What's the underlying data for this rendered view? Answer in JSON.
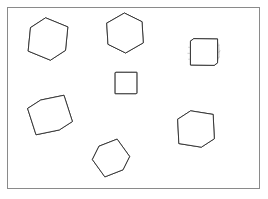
{
  "figure": {
    "background_color": "#ffffff",
    "frame": {
      "name": "outer-frame",
      "x": 7.5,
      "y": 7.5,
      "width": 252,
      "height": 181,
      "stroke_color": "#8a8a8a",
      "stroke_width": 1
    },
    "style": {
      "outline_color": "#2b2b2b",
      "grid_color": "#9a9a9a",
      "edge_color": "#3a3a3a",
      "face_fill": "#ffffff",
      "subdivisions": 4
    }
  },
  "shapes": [
    {
      "id": "cube-top-left",
      "label": "Isometric cube, top-left",
      "kind": "cube-iso",
      "center": [
        48,
        39
      ],
      "size": 27,
      "yaw": 34,
      "pitch": 26,
      "roll": 6,
      "subdivisions": 4,
      "bulge": 0
    },
    {
      "id": "cube-top-middle",
      "label": "Hexagonal silhouette cube, top-middle",
      "kind": "cube-hex",
      "center": [
        125,
        33
      ],
      "size": 25,
      "yaw": 45,
      "pitch": 35,
      "roll": -4,
      "subdivisions": 4,
      "bulge": 0
    },
    {
      "id": "cube-top-right",
      "label": "Barrel-deformed cube, top-right",
      "kind": "cube-barrel",
      "center": [
        204,
        52
      ],
      "size": 24,
      "yaw": 8,
      "pitch": 6,
      "roll": 0,
      "subdivisions": 4,
      "bulge": 0.22
    },
    {
      "id": "cube-center-flat",
      "label": "Face-on flat grid cube, center",
      "kind": "cube-flat",
      "center": [
        126,
        83
      ],
      "size": 21,
      "yaw": 2,
      "pitch": 1,
      "roll": 0,
      "subdivisions": 4,
      "bulge": 0
    },
    {
      "id": "cube-middle-left",
      "label": "Tilted cube, middle-left",
      "kind": "cube-tilt",
      "center": [
        50,
        115
      ],
      "size": 28,
      "yaw": 28,
      "pitch": 20,
      "roll": -20,
      "subdivisions": 4,
      "bulge": 0
    },
    {
      "id": "cube-bottom-middle",
      "label": "Pentagon silhouette rotated cube, bottom",
      "kind": "cube-pent",
      "center": [
        111,
        158
      ],
      "size": 23,
      "yaw": 52,
      "pitch": 30,
      "roll": 28,
      "subdivisions": 4,
      "bulge": 0
    },
    {
      "id": "cube-bottom-right",
      "label": "Isometric cube, bottom-right",
      "kind": "cube-iso",
      "center": [
        196,
        129
      ],
      "size": 26,
      "yaw": 30,
      "pitch": 22,
      "roll": -3,
      "subdivisions": 4,
      "bulge": 0
    }
  ]
}
